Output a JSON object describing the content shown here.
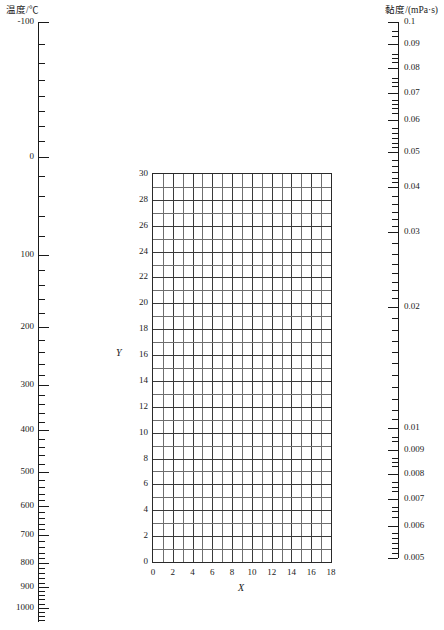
{
  "figure": {
    "kind": "nomograph",
    "background": "#ffffff",
    "ink": "#1a1a1a",
    "grid_color": "#6f6f6f"
  },
  "left_axis": {
    "header": "温度/℃",
    "name": "temperature",
    "unit": "℃",
    "scale": "inverse-nonlinear",
    "domain_top": -100,
    "domain_bottom": 1000,
    "labels": [
      "-100",
      "0",
      "100",
      "200",
      "300",
      "400",
      "500",
      "600",
      "700",
      "800",
      "900",
      "1000"
    ],
    "label_values": [
      -100,
      0,
      100,
      200,
      300,
      400,
      500,
      600,
      700,
      800,
      900,
      1000
    ],
    "label_y": [
      22,
      157,
      255,
      327,
      385,
      430,
      472,
      506,
      535,
      563,
      587,
      608
    ],
    "minor_y": [
      44,
      63,
      80,
      96,
      111,
      126,
      141,
      176,
      196,
      216,
      236,
      270,
      285,
      299,
      313,
      340,
      352,
      364,
      375,
      395,
      404,
      413,
      422,
      439,
      447,
      455,
      464,
      480,
      487,
      494,
      500,
      512,
      518,
      524,
      529,
      541,
      547,
      553,
      558,
      568,
      573,
      578,
      583,
      591,
      595,
      599,
      604,
      612,
      616,
      620
    ]
  },
  "right_axis": {
    "header": "黏度/(mPa·s)",
    "name": "viscosity",
    "unit": "mPa·s",
    "scale": "log",
    "domain_top": 0.1,
    "domain_bottom": 0.005,
    "labels": [
      "0.1",
      "0.09",
      "0.08",
      "0.07",
      "0.06",
      "0.05",
      "0.04",
      "0.03",
      "0.02",
      "0.01",
      "0.009",
      "0.008",
      "0.007",
      "0.006",
      "0.005"
    ],
    "label_values": [
      0.1,
      0.09,
      0.08,
      0.07,
      0.06,
      0.05,
      0.04,
      0.03,
      0.02,
      0.01,
      0.009,
      0.008,
      0.007,
      0.006,
      0.005
    ],
    "label_y": [
      22,
      44,
      68,
      93,
      120,
      152,
      187,
      232,
      307,
      428,
      450,
      474,
      499,
      526,
      558
    ],
    "minor_y": [
      31,
      36,
      54,
      58,
      62,
      78,
      82,
      86,
      100,
      104,
      108,
      113,
      128,
      133,
      138,
      143,
      147,
      160,
      166,
      172,
      178,
      182,
      196,
      204,
      212,
      219,
      226,
      243,
      254,
      264,
      273,
      282,
      290,
      298,
      318,
      330,
      341,
      352,
      363,
      375,
      387,
      399,
      410,
      419,
      437,
      441,
      458,
      462,
      466,
      482,
      487,
      491,
      507,
      511,
      517,
      533,
      538,
      543,
      548,
      553
    ]
  },
  "chart_data": {
    "type": "table",
    "title": "",
    "subtitle": "",
    "xlabel": "X",
    "ylabel": "Y",
    "xlim": [
      0,
      18
    ],
    "ylim": [
      0,
      30
    ],
    "grid": true,
    "legend": null,
    "x_major_step": 2,
    "x_minor_step": 1,
    "y_major_step": 2,
    "y_minor_step": 1,
    "x_tick_labels": [
      "0",
      "2",
      "4",
      "6",
      "8",
      "10",
      "12",
      "14",
      "16",
      "18"
    ],
    "x_tick_values": [
      0,
      2,
      4,
      6,
      8,
      10,
      12,
      14,
      16,
      18
    ],
    "y_tick_labels": [
      "0",
      "2",
      "4",
      "6",
      "8",
      "10",
      "12",
      "14",
      "16",
      "18",
      "20",
      "22",
      "24",
      "26",
      "28",
      "30"
    ],
    "y_tick_values": [
      0,
      2,
      4,
      6,
      8,
      10,
      12,
      14,
      16,
      18,
      20,
      22,
      24,
      26,
      28,
      30
    ],
    "series": [],
    "values": [],
    "annotations": []
  },
  "plot_box": {
    "left": 152,
    "top": 173,
    "width": 180,
    "height": 390
  }
}
